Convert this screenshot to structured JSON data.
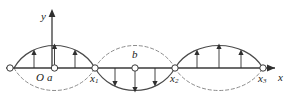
{
  "figure": {
    "type": "standing-wave-diagram",
    "colors": {
      "axis": "#3a3a3a",
      "curve_solid": "#4a4a4a",
      "curve_dashed": "#8c8c8c",
      "arrow": "#2f2f2f",
      "node_fill": "#ffffff",
      "text": "#1a1a1a"
    },
    "axes": {
      "x_label": "x",
      "y_label": "y",
      "origin_label": "O"
    },
    "point_labels": [
      {
        "name": "a",
        "text": "a"
      },
      {
        "name": "b",
        "text": "b"
      }
    ],
    "node_labels": [
      {
        "name": "x1",
        "base": "x",
        "sub": "1"
      },
      {
        "name": "x2",
        "base": "x",
        "sub": "2"
      },
      {
        "name": "x3",
        "base": "x",
        "sub": "3"
      }
    ],
    "geometry": {
      "axis_y": 68,
      "nodes_x": [
        14,
        95,
        175,
        263
      ],
      "amplitude": 26,
      "lobes": [
        {
          "index": 1,
          "solid_direction": "up",
          "arrow_direction": "up",
          "arrow_count": 3
        },
        {
          "index": 2,
          "solid_direction": "down",
          "arrow_direction": "down",
          "arrow_count": 3
        },
        {
          "index": 3,
          "solid_direction": "up",
          "arrow_direction": "up",
          "arrow_count": 3
        }
      ]
    }
  }
}
